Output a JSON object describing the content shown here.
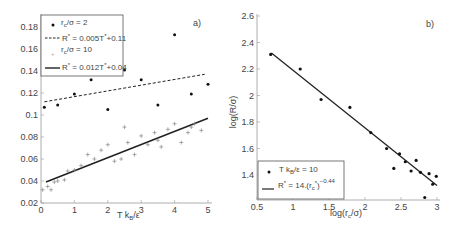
{
  "chart_data": [
    {
      "panel": "a)",
      "type": "scatter",
      "xlabel": "T k_B/ε",
      "ylabel": "",
      "xlim": [
        0,
        5
      ],
      "ylim": [
        0.02,
        0.19
      ],
      "xticks": [
        0,
        1,
        2,
        3,
        4,
        5
      ],
      "yticks": [
        0.02,
        0.04,
        0.06,
        0.08,
        0.1,
        0.12,
        0.14,
        0.16,
        0.18
      ],
      "grid": false,
      "legend_position": "upper left",
      "series": [
        {
          "name": "r_c/σ = 2",
          "marker": "dot",
          "x": [
            0.1,
            0.5,
            1.0,
            1.5,
            2.0,
            2.5,
            3.0,
            3.5,
            4.0,
            4.5,
            5.0
          ],
          "y": [
            0.107,
            0.109,
            0.119,
            0.132,
            0.105,
            0.141,
            0.132,
            0.109,
            0.173,
            0.119,
            0.128
          ]
        },
        {
          "name": "R* = 0.005T* + 0.11",
          "type": "line",
          "style": "dashed",
          "x": [
            0.1,
            4.9
          ],
          "y": [
            0.112,
            0.137
          ]
        },
        {
          "name": "r_c/σ = 10",
          "marker": "plus",
          "x": [
            0.05,
            0.2,
            0.3,
            0.4,
            0.5,
            0.7,
            0.8,
            1.0,
            1.2,
            1.4,
            1.6,
            1.8,
            2.0,
            2.2,
            2.4,
            2.5,
            2.6,
            2.8,
            3.0,
            3.2,
            3.4,
            3.5,
            3.6,
            3.8,
            4.0,
            4.2,
            4.4,
            4.5,
            4.6,
            4.8
          ],
          "y": [
            0.032,
            0.035,
            0.032,
            0.039,
            0.04,
            0.041,
            0.049,
            0.05,
            0.054,
            0.064,
            0.06,
            0.068,
            0.073,
            0.058,
            0.06,
            0.089,
            0.075,
            0.064,
            0.081,
            0.073,
            0.084,
            0.077,
            0.071,
            0.087,
            0.092,
            0.075,
            0.084,
            0.089,
            0.092,
            0.086
          ]
        },
        {
          "name": "R* = 0.012T* + 0.04",
          "type": "line",
          "style": "solid",
          "x": [
            0.15,
            5.0
          ],
          "y": [
            0.039,
            0.097
          ]
        }
      ]
    },
    {
      "panel": "b)",
      "type": "scatter",
      "xlabel": "log(r_c/σ)",
      "ylabel": "log(R/σ)",
      "xlim": [
        0.5,
        3
      ],
      "ylim": [
        1.21,
        2.6
      ],
      "xticks": [
        0.5,
        1,
        1.5,
        2,
        2.5,
        3
      ],
      "yticks": [
        1.4,
        1.6,
        1.8,
        2,
        2.2,
        2.4,
        2.6
      ],
      "grid": false,
      "legend_position": "lower left",
      "series": [
        {
          "name": "T k_B/ε = 10",
          "marker": "dot",
          "x": [
            0.69,
            1.1,
            1.39,
            1.79,
            2.08,
            2.3,
            2.4,
            2.48,
            2.56,
            2.64,
            2.71,
            2.77,
            2.83,
            2.89,
            2.94,
            2.99
          ],
          "y": [
            2.31,
            2.2,
            1.97,
            1.91,
            1.72,
            1.6,
            1.45,
            1.56,
            1.5,
            1.43,
            1.51,
            1.42,
            1.23,
            1.41,
            1.33,
            1.39
          ]
        },
        {
          "name": "R* = 14·(r_c*)^-0.44",
          "type": "line",
          "style": "solid",
          "x": [
            0.7,
            3.0
          ],
          "y": [
            2.32,
            1.32
          ]
        }
      ]
    }
  ],
  "panel_a": {
    "label": "a)",
    "xlabel_main": "T k",
    "xlabel_sub": "B",
    "xlabel_tail": "/ε",
    "yticks": [
      "0.02",
      "0.04",
      "0.06",
      "0.08",
      "0.1",
      "0.12",
      "0.14",
      "0.16",
      "0.18"
    ],
    "xticks": [
      "0",
      "1",
      "2",
      "3",
      "4",
      "5"
    ],
    "legend": {
      "item1": "r",
      "item1_sub": "c",
      "item1_tail": "/σ = 2",
      "item2": "R",
      "item2_sup": "*",
      "item2_tail": " = 0.005T",
      "item2_sup2": "*",
      "item2_tail2": "+0.11",
      "item3": "r",
      "item3_sub": "c",
      "item3_tail": "/σ = 10",
      "item4": "R",
      "item4_sup": "*",
      "item4_tail": " = 0.012T",
      "item4_sup2": "*",
      "item4_tail2": "+0.04"
    }
  },
  "panel_b": {
    "label": "b)",
    "ylabel": "log(R/σ)",
    "xlabel_main": "log(r",
    "xlabel_sub": "c",
    "xlabel_tail": "/σ)",
    "yticks": [
      "1.4",
      "1.6",
      "1.8",
      "2",
      "2.2",
      "2.4",
      "2.6"
    ],
    "xticks": [
      "0.5",
      "1",
      "1.5",
      "2",
      "2.5",
      "3"
    ],
    "legend": {
      "item1": "T k",
      "item1_sub": "B",
      "item1_tail": "/ε = 10",
      "item2": "R",
      "item2_sup": "*",
      "item2_tail": " = 14.(r",
      "item2_sub2": "c",
      "item2_sup3": "*",
      "item2_tail2": ")",
      "item2_exp": "−0.44"
    }
  },
  "colors": {
    "axis": "#888888",
    "data": "#111111",
    "text": "#444444"
  }
}
